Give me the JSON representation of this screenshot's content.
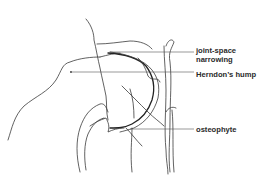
{
  "figure": {
    "labels": [
      {
        "id": "joint-space-narrowing",
        "lines": [
          "joint-space",
          "narrowing"
        ]
      },
      {
        "id": "herndons-hump",
        "lines": [
          "Herndon’s hump"
        ]
      },
      {
        "id": "osteophyte",
        "lines": [
          "osteophyte"
        ]
      }
    ],
    "colors": {
      "line": "#3a3a3a",
      "text": "#2a2a2a",
      "background": "#ffffff"
    }
  }
}
